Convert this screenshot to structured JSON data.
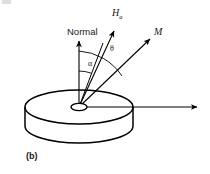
{
  "figure": {
    "panel_label": "(b)",
    "background_color": "#ffffff",
    "stroke_color": "#000000",
    "labels": {
      "normal": "Normal",
      "applied_field_symbol": "H",
      "applied_field_subscript": "a",
      "magnetization": "M",
      "angle_theta": "θ",
      "angle_alpha": "α"
    },
    "geometry": {
      "disk_center_x": 79,
      "disk_center_y": 107,
      "disk_rx": 54,
      "disk_ry": 17,
      "disk_thickness": 19,
      "origin_x": 79,
      "origin_y": 107,
      "normal_tip_x": 79,
      "normal_tip_y": 40,
      "applied_field_tip_x": 115,
      "applied_field_tip_y": 29,
      "magnetization_tip_x": 151,
      "magnetization_tip_y": 38,
      "inplane_tip_x": 199,
      "inplane_tip_y": 107,
      "arc_alpha_radius": 36,
      "arc_theta_radius": 56
    },
    "vectors": [
      {
        "name": "normal",
        "label": "Normal",
        "angle_from_normal_deg": 0
      },
      {
        "name": "intermediate",
        "label": "",
        "angle_from_normal_deg": 20
      },
      {
        "name": "applied-field",
        "label": "H_a",
        "angle_from_normal_deg": 28
      },
      {
        "name": "magnetization",
        "label": "M",
        "angle_from_normal_deg": 52
      },
      {
        "name": "in-plane-reference",
        "label": "",
        "angle_from_normal_deg": 90
      }
    ],
    "angles": [
      {
        "name": "alpha",
        "symbol": "α",
        "between": [
          "normal",
          "intermediate"
        ]
      },
      {
        "name": "theta",
        "symbol": "θ",
        "between": [
          "intermediate",
          "applied-field"
        ]
      }
    ]
  }
}
